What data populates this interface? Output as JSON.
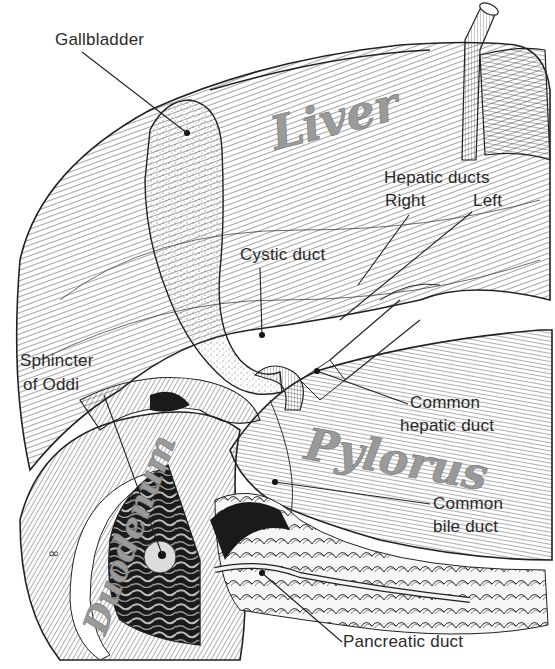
{
  "diagram": {
    "colors": {
      "ink": "#222222",
      "background": "#ffffff",
      "organ_label": "#9a9a9a",
      "lumen": "#1a1a1a"
    },
    "organ_labels": {
      "liver": "Liver",
      "pylorus": "Pylorus",
      "duodenum": "Duodenum"
    },
    "callouts": {
      "gallbladder": "Gallbladder",
      "hepatic_ducts_title": "Hepatic ducts",
      "hepatic_right": "Right",
      "hepatic_left": "Left",
      "cystic_duct": "Cystic duct",
      "sphincter_line1": "Sphincter",
      "sphincter_line2": "of Oddi",
      "common_hepatic_line1": "Common",
      "common_hepatic_line2": "hepatic duct",
      "common_bile_line1": "Common",
      "common_bile_line2": "bile duct",
      "pancreatic_duct": "Pancreatic duct"
    }
  }
}
